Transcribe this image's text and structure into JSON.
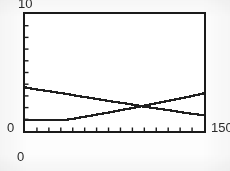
{
  "figure": {
    "kind": "scanned-line-plot",
    "background_color": "#fdfdfd",
    "plot_background_color": "#ffffff",
    "frame_color": "#1a1a1a",
    "curve_color": "#1f1f1f"
  },
  "labels": {
    "y_max": "10",
    "y_min": "0",
    "x_min": "0",
    "x_max": "150"
  },
  "chart_data": {
    "type": "line",
    "title": "",
    "xlabel": "",
    "ylabel": "",
    "xlim": [
      0,
      150
    ],
    "ylim": [
      0,
      10
    ],
    "grid": false,
    "legend": null,
    "x_tick_labels": [
      "0",
      "150"
    ],
    "y_tick_labels": [
      "0",
      "10"
    ],
    "x_tick_count": 15,
    "y_tick_count": 10,
    "x_tick_step": 10,
    "y_tick_step": 1,
    "ticks_inside": true,
    "annotations": [],
    "intersection": {
      "x": 98,
      "y": 2.1
    },
    "series": [
      {
        "name": "descending-curve",
        "style": "solid",
        "x": [
          0,
          10,
          20,
          30,
          40,
          50,
          60,
          70,
          80,
          90,
          100,
          110,
          120,
          130,
          140,
          150
        ],
        "values": [
          3.72,
          3.55,
          3.4,
          3.24,
          3.07,
          2.9,
          2.74,
          2.57,
          2.41,
          2.25,
          2.08,
          1.93,
          1.78,
          1.62,
          1.47,
          1.34
        ]
      },
      {
        "name": "ascending-curve",
        "style": "solid",
        "x": [
          0,
          10,
          20,
          30,
          35,
          40,
          50,
          60,
          70,
          80,
          90,
          100,
          110,
          120,
          130,
          140,
          150
        ],
        "values": [
          0.95,
          0.95,
          0.95,
          0.95,
          0.97,
          1.05,
          1.22,
          1.4,
          1.58,
          1.78,
          1.97,
          2.17,
          2.38,
          2.58,
          2.79,
          3.0,
          3.22
        ]
      }
    ]
  }
}
